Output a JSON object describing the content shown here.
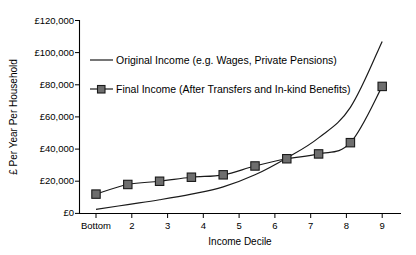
{
  "chart_data": {
    "type": "line",
    "title": "",
    "xlabel": "Income Decile",
    "ylabel": "£ Per Year Per Household",
    "categories": [
      "Bottom",
      "2",
      "3",
      "4",
      "5",
      "6",
      "7",
      "8",
      "9",
      "Top"
    ],
    "ylim": [
      0,
      120000
    ],
    "ytick_labels": [
      "£0",
      "£20,000",
      "£40,000",
      "£60,000",
      "£80,000",
      "£100,000",
      "£120,000"
    ],
    "ytick_values": [
      0,
      20000,
      40000,
      60000,
      80000,
      100000,
      120000
    ],
    "grid": false,
    "legend_position": "upper-left-inside",
    "series": [
      {
        "name": "Original Income (e.g. Wages, Private Pensions)",
        "marker": "none",
        "color": "#1a1a1a",
        "values": [
          2500,
          5500,
          8500,
          12000,
          16500,
          24000,
          34500,
          47000,
          66000,
          107000
        ]
      },
      {
        "name": "Final Income (After Transfers and In-kind Benefits)",
        "marker": "square",
        "color": "#6e6e6e",
        "values": [
          12000,
          18000,
          20000,
          22500,
          24000,
          29500,
          34000,
          37000,
          44000,
          79000
        ]
      }
    ]
  },
  "legend": {
    "entries": [
      {
        "label": "Original Income (e.g. Wages, Private Pensions)",
        "swatch": "line-swatch"
      },
      {
        "label": "Final Income (After Transfers and In-kind Benefits)",
        "swatch": "line-marker-swatch"
      }
    ]
  },
  "colors": {
    "axis": "#000000",
    "original_line": "#1a1a1a",
    "final_line": "#1a1a1a",
    "marker_fill": "#6e6e6e",
    "background": "#ffffff"
  }
}
